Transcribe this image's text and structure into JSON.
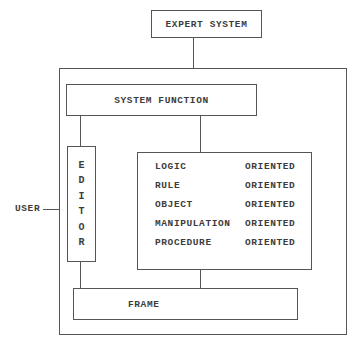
{
  "diagram": {
    "nodes": {
      "expert_system": "EXPERT SYSTEM",
      "system_function": "SYSTEM FUNCTION",
      "editor": [
        "E",
        "D",
        "I",
        "T",
        "O",
        "R"
      ],
      "frame": "FRAME",
      "user": "USER"
    },
    "oriented_list": [
      {
        "name": "LOGIC",
        "type": "ORIENTED"
      },
      {
        "name": "RULE",
        "type": "ORIENTED"
      },
      {
        "name": "OBJECT",
        "type": "ORIENTED"
      },
      {
        "name": "MANIPULATION",
        "type": "ORIENTED"
      },
      {
        "name": "PROCEDURE",
        "type": "ORIENTED"
      }
    ],
    "edges": [
      [
        "EXPERT SYSTEM",
        "outer system container"
      ],
      [
        "SYSTEM FUNCTION",
        "EDITOR"
      ],
      [
        "SYSTEM FUNCTION",
        "ORIENTED list"
      ],
      [
        "EDITOR",
        "FRAME"
      ],
      [
        "ORIENTED list",
        "FRAME"
      ],
      [
        "USER",
        "outer system container"
      ]
    ],
    "colors": {
      "line": "#555555",
      "text": "#3c3c3c",
      "background": "#ffffff"
    }
  }
}
